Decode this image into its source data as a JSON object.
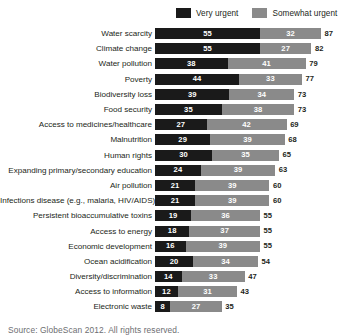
{
  "legend": {
    "items": [
      {
        "label": "Very urgent",
        "color": "#1a1a1a",
        "icon": "legend-swatch-very-urgent"
      },
      {
        "label": "Somewhat urgent",
        "color": "#8a8a8a",
        "icon": "legend-swatch-somewhat-urgent"
      }
    ]
  },
  "source": "Source: GlobeScan 2012. All rights reserved.",
  "chart_data": {
    "type": "bar",
    "orientation": "horizontal",
    "stacked": true,
    "title": "",
    "subtitle": "",
    "xlabel": "",
    "ylabel": "",
    "xlim": [
      0,
      87
    ],
    "grid": false,
    "legend_position": "top-right",
    "categories": [
      "Water scarcity",
      "Climate change",
      "Water pollution",
      "Poverty",
      "Biodiversity loss",
      "Food security",
      "Access to medicines/healthcare",
      "Malnutrition",
      "Human rights",
      "Expanding primary/secondary education",
      "Air pollution",
      "Infections disease (e.g., malaria, HIV/AIDS)",
      "Persistent bioaccumulative toxins",
      "Access to energy",
      "Economic development",
      "Ocean acidification",
      "Diversity/discrimination",
      "Access to information",
      "Electronic waste"
    ],
    "series": [
      {
        "name": "Very urgent",
        "color": "#1a1a1a",
        "values": [
          55,
          55,
          38,
          44,
          39,
          35,
          27,
          29,
          30,
          24,
          21,
          21,
          19,
          18,
          16,
          20,
          14,
          12,
          8
        ]
      },
      {
        "name": "Somewhat urgent",
        "color": "#8a8a8a",
        "values": [
          32,
          27,
          41,
          33,
          34,
          38,
          42,
          39,
          35,
          39,
          39,
          39,
          36,
          37,
          39,
          34,
          33,
          31,
          27
        ]
      }
    ],
    "totals": [
      87,
      82,
      79,
      77,
      73,
      73,
      69,
      68,
      65,
      63,
      60,
      60,
      55,
      55,
      55,
      54,
      47,
      43,
      35
    ]
  }
}
